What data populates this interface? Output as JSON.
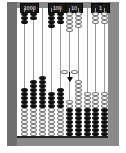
{
  "labels": [
    {
      "text": "1000",
      "left": 20,
      "width": 17
    },
    {
      "text": "100",
      "left": 48,
      "width": 16
    },
    {
      "text": "10",
      "left": 65,
      "width": 16
    },
    {
      "text": "1",
      "left": 91,
      "width": 17
    }
  ],
  "colors": {
    "frame": "#8a8a8a",
    "frame_dark": "#6e6e6e",
    "bead_black": "#111111",
    "bead_white": "#ffffff"
  },
  "rods": [
    {
      "x": 24,
      "top_black": 3,
      "top_white": 0,
      "bottom_black": 5,
      "bottom_white": 7,
      "bottom_black_top": 88
    },
    {
      "x": 33,
      "top_black": 2,
      "top_white": 0,
      "bottom_black": 7,
      "bottom_white": 7,
      "bottom_black_top": 80
    },
    {
      "x": 42,
      "top_black": 0,
      "top_white": 0,
      "bottom_black": 8,
      "bottom_white": 7,
      "bottom_black_top": 76
    },
    {
      "x": 51,
      "top_black": 4,
      "top_white": 0,
      "bottom_black": 4,
      "bottom_white": 7,
      "bottom_black_top": 92
    },
    {
      "x": 60,
      "top_black": 3,
      "top_white": 0,
      "bottom_black": 5,
      "bottom_white": 7,
      "bottom_black_top": 88
    },
    {
      "x": 69,
      "top_black": 0,
      "top_white": 5,
      "bottom_white": 2,
      "bottom_black": 7,
      "bottom_white_top": 100
    },
    {
      "x": 78,
      "top_black": 0,
      "top_white": 4,
      "bottom_white": 7,
      "bottom_black": 7,
      "bottom_white_top": 80
    },
    {
      "x": 87,
      "top_black": 0,
      "top_white": 0,
      "bottom_white": 4,
      "bottom_black": 7,
      "bottom_white_top": 92
    },
    {
      "x": 95,
      "top_black": 0,
      "top_white": 3,
      "bottom_white": 4,
      "bottom_black": 7,
      "bottom_white_top": 92
    },
    {
      "x": 104,
      "top_black": 0,
      "top_white": 3,
      "bottom_white": 4,
      "bottom_black": 7,
      "bottom_white_top": 92
    }
  ],
  "cursor": {
    "x": 69,
    "y": 72,
    "held_beads": 2
  }
}
